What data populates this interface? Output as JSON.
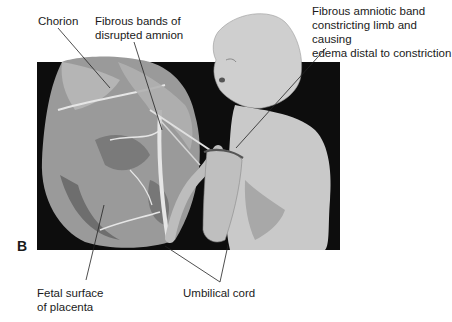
{
  "figure": {
    "panel_letter": "B",
    "labels": {
      "chorion": "Chorion",
      "fibrous_bands": "Fibrous bands  of\ndisrupted amnion",
      "amniotic_band": "Fibrous amniotic band\nconstricting limb and causing\nedema distal to constriction",
      "fetal_surface": "Fetal surface\nof placenta",
      "umbilical_cord": "Umbilical cord"
    },
    "colors": {
      "background_box": "#0d0d0d",
      "placenta": "#9a9a9a",
      "placenta_dark": "#6e6e6e",
      "fetus": "#c9c9c9",
      "fetus_shadow": "#a8a8a8",
      "vessel": "#e6e6e6",
      "leader_line": "#222222"
    }
  }
}
